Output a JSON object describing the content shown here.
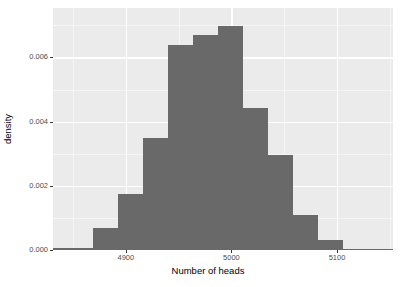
{
  "chart_data": {
    "type": "bar",
    "title": "",
    "subtitle": "",
    "xlabel": "Number of heads",
    "ylabel": "density",
    "xlim": [
      4831,
      5153
    ],
    "ylim": [
      0.0,
      0.00754
    ],
    "grid": true,
    "legend": null,
    "xticks": [
      {
        "value": 4900,
        "label": "4900"
      },
      {
        "value": 5000,
        "label": "5000"
      },
      {
        "value": 5100,
        "label": "5100"
      }
    ],
    "yticks": [
      {
        "value": 0.0,
        "label": "0.000"
      },
      {
        "value": 0.002,
        "label": "0.002"
      },
      {
        "value": 0.004,
        "label": "0.004"
      },
      {
        "value": 0.006,
        "label": "0.006"
      }
    ],
    "x_minor_gridlines": [
      4850,
      4950,
      5050,
      5150
    ],
    "y_minor_gridlines": [
      0.001,
      0.003,
      0.005,
      0.007
    ],
    "bin_width": 23.7,
    "bars": [
      {
        "bin_start": 4831.0,
        "bin_end": 4869.0,
        "value": 6e-05
      },
      {
        "bin_start": 4869.0,
        "bin_end": 4892.7,
        "value": 0.00068
      },
      {
        "bin_start": 4892.7,
        "bin_end": 4916.4,
        "value": 0.00173
      },
      {
        "bin_start": 4916.4,
        "bin_end": 4940.1,
        "value": 0.00349
      },
      {
        "bin_start": 4940.1,
        "bin_end": 4963.7,
        "value": 0.0064
      },
      {
        "bin_start": 4963.7,
        "bin_end": 4987.4,
        "value": 0.00671
      },
      {
        "bin_start": 4987.4,
        "bin_end": 5011.1,
        "value": 0.00699
      },
      {
        "bin_start": 5011.1,
        "bin_end": 5034.8,
        "value": 0.00442
      },
      {
        "bin_start": 5034.8,
        "bin_end": 5058.5,
        "value": 0.00297
      },
      {
        "bin_start": 5058.5,
        "bin_end": 5082.2,
        "value": 0.00108
      },
      {
        "bin_start": 5082.2,
        "bin_end": 5105.8,
        "value": 0.00031
      },
      {
        "bin_start": 5105.8,
        "bin_end": 5153.0,
        "value": 3e-05
      }
    ],
    "colors": {
      "bar_fill": "#696969",
      "panel_background": "#ebebeb",
      "gridline_major": "#ffffff",
      "gridline_minor": "#f5f5f5",
      "axis_text": "#4d4d4d",
      "axis_title": "#000000",
      "figure_background": "#ffffff"
    }
  }
}
